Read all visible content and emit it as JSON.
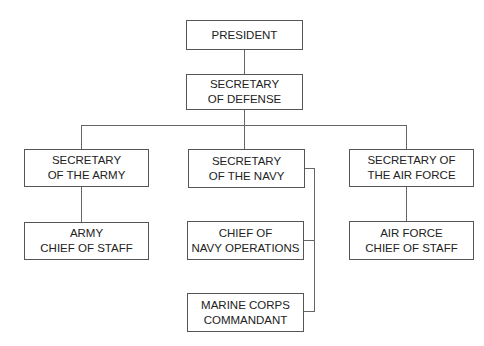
{
  "chart": {
    "nodes": {
      "president": "PRESIDENT",
      "secdef": "SECRETARY\nOF DEFENSE",
      "sec_army": "SECRETARY\nOF THE ARMY",
      "army_cos": "ARMY\nCHIEF OF STAFF",
      "sec_navy": "SECRETARY\nOF THE NAVY",
      "cno": "CHIEF OF\nNAVY OPERATIONS",
      "marine": "MARINE CORPS\nCOMMANDANT",
      "sec_af": "SECRETARY OF\nTHE AIR FORCE",
      "af_cos": "AIR FORCE\nCHIEF OF STAFF"
    },
    "colors": {
      "line": "#666666",
      "border": "#555555",
      "text": "#222222"
    }
  }
}
